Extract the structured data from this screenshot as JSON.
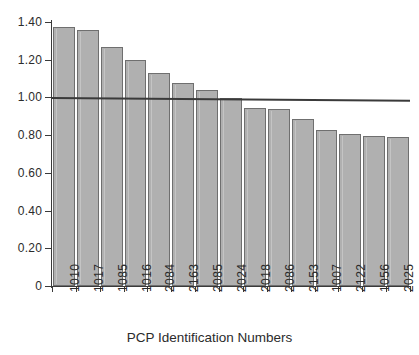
{
  "chart_data": {
    "type": "bar",
    "title": "",
    "subtitle": "",
    "xlabel": "PCP Identification Numbers",
    "ylabel": "",
    "categories": [
      "1010",
      "1017",
      "1085",
      "1016",
      "2084",
      "2163",
      "2085",
      "2024",
      "2018",
      "2086",
      "2153",
      "1007",
      "2122",
      "1056",
      "2025"
    ],
    "values": [
      1.375,
      1.36,
      1.265,
      1.2,
      1.13,
      1.075,
      1.04,
      0.995,
      0.945,
      0.94,
      0.885,
      0.825,
      0.805,
      0.795,
      0.79
    ],
    "series": [
      {
        "name": "PCP value",
        "values": [
          1.375,
          1.36,
          1.265,
          1.2,
          1.13,
          1.075,
          1.04,
          0.995,
          0.945,
          0.94,
          0.885,
          0.825,
          0.805,
          0.795,
          0.79
        ]
      }
    ],
    "reference_line": {
      "name": "reference-line",
      "y_start": 1.0,
      "y_end": 0.985,
      "style": "solid"
    },
    "ylim": [
      0,
      1.4
    ],
    "y_ticks": [
      0,
      0.2,
      0.4,
      0.6,
      0.8,
      1.0,
      1.2,
      1.4
    ],
    "y_tick_labels": [
      "0",
      "0.20",
      "0.40",
      "0.60",
      "0.80",
      "1.00",
      "1.20",
      "1.40"
    ],
    "grid": false,
    "legend": null,
    "colors": {
      "bar_fill": "#b0b0b0",
      "bar_border": "#6f6f6f",
      "axis": "#3a3a3a",
      "reference_line": "#3a3a3a",
      "text": "#2b2b2b",
      "background": "#ffffff"
    }
  }
}
